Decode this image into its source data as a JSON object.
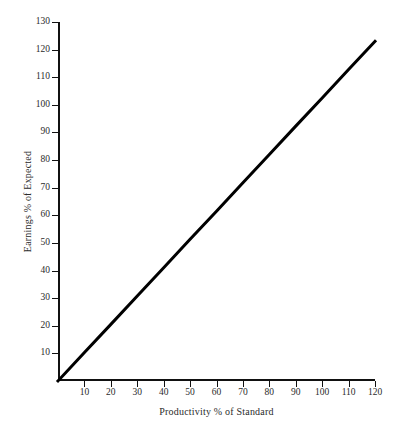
{
  "chart_data": {
    "type": "line",
    "title": "",
    "subtitle": "",
    "xlabel": "Productivity % of Standard",
    "ylabel": "Earnings % of Expected",
    "xlim": [
      0,
      120
    ],
    "ylim": [
      0,
      130
    ],
    "xticks": [
      10,
      20,
      30,
      40,
      50,
      60,
      70,
      80,
      90,
      100,
      110,
      120
    ],
    "xticklabels": [
      "10",
      "20",
      "30",
      "40",
      "50",
      "60",
      "70",
      "80",
      "90",
      "100",
      "110",
      "120"
    ],
    "yticks": [
      10,
      20,
      30,
      40,
      50,
      60,
      70,
      80,
      90,
      100,
      110,
      120,
      130
    ],
    "yticklabels": [
      "10",
      "20",
      "30",
      "40",
      "50",
      "60",
      "70",
      "80",
      "90",
      "100",
      "110",
      "120",
      "130"
    ],
    "grid": false,
    "legend": null,
    "annotations": [],
    "series": [
      {
        "name": "Earnings vs Productivity",
        "color": "#000000",
        "linewidth": 3,
        "x": [
          0,
          10,
          20,
          30,
          40,
          50,
          60,
          70,
          80,
          90,
          100,
          110,
          120
        ],
        "values": [
          0,
          10.3,
          20.5,
          30.8,
          41.0,
          51.3,
          61.5,
          71.8,
          82.0,
          92.3,
          102.5,
          112.8,
          123.0
        ]
      }
    ]
  }
}
